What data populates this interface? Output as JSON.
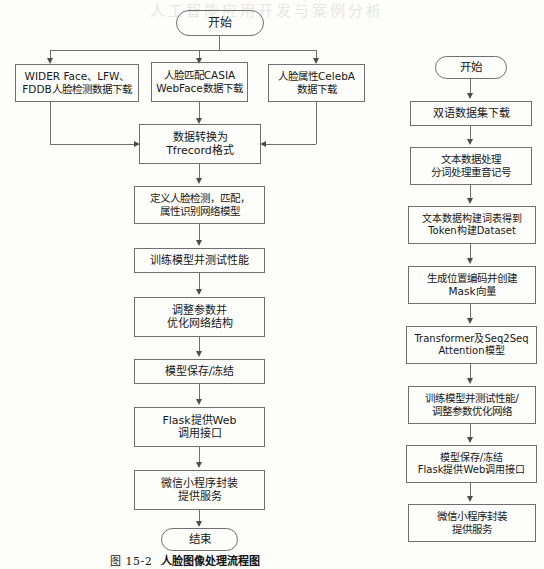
{
  "page": {
    "width": 544,
    "height": 569,
    "background": "#fdfdfc",
    "stroke_color": "#6f6f6f",
    "text_color": "#171717",
    "bleed_text": "人工智能应用开发与案例分析"
  },
  "figure_left": {
    "caption_number": "图 15-2",
    "caption_title": "人脸图像处理流程图",
    "nodes": {
      "start": "开始",
      "dataset_face_detect": "WIDER Face、LFW、\nFDDB人脸检测数据下载",
      "dataset_face_match": "人脸匹配CASIA\nWebFace数据下载",
      "dataset_face_attr": "人脸属性CelebA\n数据下载",
      "convert_tfrecord": "数据转换为\nTfrecord格式",
      "define_network": "定义人脸检测，匹配，\n属性识别网络模型",
      "train_test": "训练模型并测试性能",
      "tune_optimize": "调整参数并\n优化网络结构",
      "save_freeze": "模型保存/冻结",
      "flask_web": "Flask提供Web\n调用接口",
      "wechat_service": "微信小程序封装\n提供服务",
      "end": "结束"
    }
  },
  "figure_right": {
    "caption_number": "图 15-3",
    "caption_title": "机器翻译流程图",
    "nodes": {
      "start": "开始",
      "bilingual_dataset": "双语数据集下载",
      "text_process": "文本数据处理\n分词处理重音记号",
      "vocab_dataset": "文本数据构建词表得到\nToken构建Dataset",
      "pos_mask": "生成位置编码并创建\nMask向量",
      "transformer_model": "Transformer及Seq2Seq\nAttention模型",
      "train_tune": "训练模型并测试性能/\n调整参数优化网络",
      "save_flask": "模型保存/冻结\nFlask提供Web调用接口",
      "wechat_service": "微信小程序封装\n提供服务",
      "end": "结束"
    }
  }
}
